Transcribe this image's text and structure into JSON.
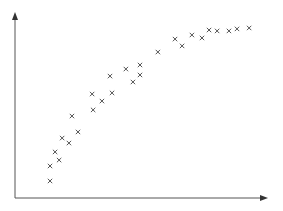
{
  "chart_data": {
    "type": "scatter",
    "title": "",
    "xlabel": "",
    "ylabel": "",
    "xlim": [
      0,
      100
    ],
    "ylim": [
      0,
      100
    ],
    "grid": false,
    "legend": null,
    "marker": "x",
    "axis_style": "arrows",
    "points": [
      {
        "x": 13.9,
        "y": 9.2
      },
      {
        "x": 13.9,
        "y": 17.3
      },
      {
        "x": 17.5,
        "y": 20.5
      },
      {
        "x": 15.9,
        "y": 24.9
      },
      {
        "x": 21.4,
        "y": 29.7
      },
      {
        "x": 18.7,
        "y": 32.4
      },
      {
        "x": 25.0,
        "y": 35.7
      },
      {
        "x": 22.6,
        "y": 44.3
      },
      {
        "x": 31.0,
        "y": 47.6
      },
      {
        "x": 30.6,
        "y": 56.2
      },
      {
        "x": 34.5,
        "y": 52.4
      },
      {
        "x": 38.5,
        "y": 56.8
      },
      {
        "x": 37.7,
        "y": 65.9
      },
      {
        "x": 44.0,
        "y": 69.7
      },
      {
        "x": 46.8,
        "y": 62.7
      },
      {
        "x": 49.6,
        "y": 66.5
      },
      {
        "x": 49.6,
        "y": 71.9
      },
      {
        "x": 56.7,
        "y": 78.9
      },
      {
        "x": 63.5,
        "y": 85.9
      },
      {
        "x": 66.3,
        "y": 82.2
      },
      {
        "x": 70.2,
        "y": 88.1
      },
      {
        "x": 74.2,
        "y": 86.5
      },
      {
        "x": 77.0,
        "y": 90.8
      },
      {
        "x": 80.2,
        "y": 90.3
      },
      {
        "x": 84.9,
        "y": 90.3
      },
      {
        "x": 88.1,
        "y": 91.4
      },
      {
        "x": 92.9,
        "y": 91.9
      }
    ]
  },
  "colors": {
    "axis": "#555555",
    "marker": "#555555",
    "background": "#ffffff"
  }
}
